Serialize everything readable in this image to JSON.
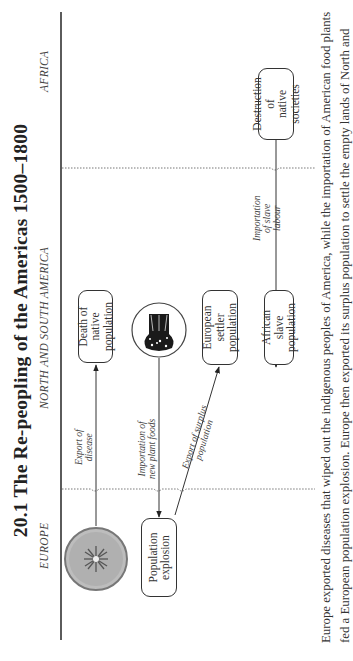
{
  "title": "20.1 The Re-peopling of the Americas 1500–1800",
  "regions": {
    "europe": "EUROPE",
    "americas": "NORTH AND SOUTH AMERICA",
    "africa": "AFRICA"
  },
  "nodes": {
    "disease": {
      "icon": "virus-icon"
    },
    "population_explosion": {
      "line1": "Population",
      "line2": "explosion"
    },
    "death_native": {
      "line1": "Death of",
      "line2": "native",
      "line3": "population"
    },
    "plant_foods": {
      "icon": "wheat-sheaf-icon"
    },
    "european_settler": {
      "line1": "European",
      "line2": "settler",
      "line3": "population"
    },
    "african_slave": {
      "line1": "African",
      "line2": "slave",
      "line3": "population"
    },
    "destruction_native": {
      "line1": "Destruction",
      "line2": "of",
      "line3": "native societies"
    }
  },
  "flows": {
    "export_disease": {
      "line1": "Export of",
      "line2": "disease"
    },
    "import_plant_foods": {
      "line1": "Importation of",
      "line2": "new plant foods"
    },
    "export_surplus": {
      "line1": "Export of surplus",
      "line2": "population"
    },
    "import_slave_labour": {
      "line1": "Importation",
      "line2": "of slave",
      "line3": "labour"
    }
  },
  "caption": {
    "line1": "Europe exported diseases that wiped out the indigenous peoples of America, while the importation of American food plants",
    "line2": "fed a European population explosion. Europe then exported its surplus population to settle the empty lands of North and"
  }
}
